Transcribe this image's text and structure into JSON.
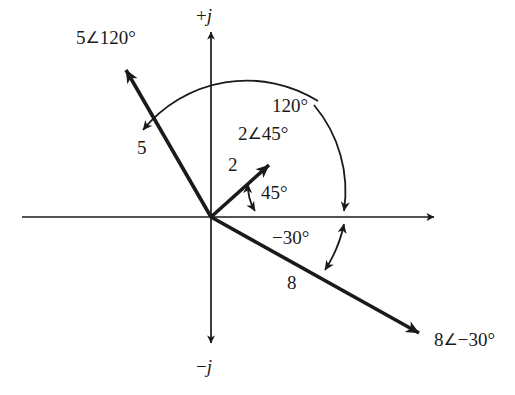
{
  "figure": {
    "background_color": "#ffffff",
    "ink_color": "#1a1a1a",
    "width": 515,
    "height": 395
  },
  "axes": {
    "origin": {
      "x": 211,
      "y": 217
    },
    "real_axis": {
      "x_start": 22,
      "x_end": 438,
      "y": 217
    },
    "imag_axis": {
      "x": 211,
      "y_start": 28,
      "y_end": 347
    },
    "positive_imag_label": {
      "sign": "+",
      "symbol": "j",
      "x": 196,
      "y": 6
    },
    "negative_imag_label": {
      "sign": "−",
      "symbol": "j",
      "x": 196,
      "y": 357
    }
  },
  "phasors": [
    {
      "id": "phasor-5",
      "magnitude_label": "5",
      "angle_deg": 120,
      "full_label": "5 ∠120°",
      "label_magnitude": "5",
      "label_angle_glyph": "∠",
      "label_angle_text": "120°",
      "tip": {
        "x": 122,
        "y": 63
      },
      "label_pos": {
        "x": 76,
        "y": 28
      },
      "magnitude_label_pos": {
        "x": 137,
        "y": 138
      }
    },
    {
      "id": "phasor-2",
      "magnitude_label": "2",
      "angle_deg": 45,
      "full_label": "2 ∠45°",
      "label_magnitude": "2",
      "label_angle_glyph": "∠",
      "label_angle_text": "45°",
      "tip": {
        "x": 274,
        "y": 160
      },
      "label_pos": {
        "x": 238,
        "y": 124
      },
      "magnitude_label_pos": {
        "x": 228,
        "y": 155
      }
    },
    {
      "id": "phasor-8",
      "magnitude_label": "8",
      "angle_deg": -30,
      "full_label": "8 ∠−30°",
      "label_magnitude": "8",
      "label_angle_glyph": "∠",
      "label_angle_text": "−30°",
      "tip": {
        "x": 425,
        "y": 338
      },
      "label_pos": {
        "x": 434,
        "y": 330
      },
      "magnitude_label_pos": {
        "x": 287,
        "y": 273
      }
    }
  ],
  "angle_arcs": [
    {
      "id": "arc-120",
      "label": "120°",
      "value_deg": 120,
      "from": "positive real axis",
      "to": "5 ∠120° phasor",
      "radius": 134,
      "label_pos": {
        "x": 272,
        "y": 96
      },
      "arrowheads": "both"
    },
    {
      "id": "arc-45",
      "label": "45°",
      "value_deg": 45,
      "from": "positive real axis",
      "to": "2 ∠45° phasor",
      "radius": 48,
      "label_pos": {
        "x": 261,
        "y": 183
      },
      "arrowheads": "both"
    },
    {
      "id": "arc-neg30",
      "label": "−30°",
      "value_deg": -30,
      "from": "positive real axis",
      "to": "8 ∠−30° phasor",
      "radius": 134,
      "label_pos": {
        "x": 272,
        "y": 228
      },
      "arrowheads": "both"
    }
  ]
}
